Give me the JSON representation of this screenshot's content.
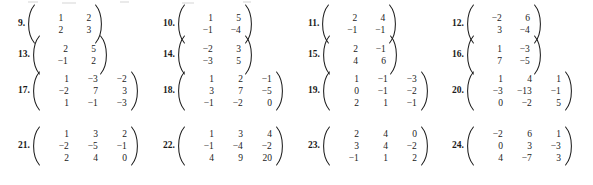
{
  "page": {
    "document_type": "math-textbook-exercise-list",
    "exercises": [
      {
        "number": "9.",
        "rows": [
          [
            "1",
            "2"
          ],
          [
            "2",
            "3"
          ]
        ],
        "size": 2,
        "column": 0,
        "row": 0
      },
      {
        "number": "10.",
        "rows": [
          [
            "1",
            "5"
          ],
          [
            "−1",
            "−4"
          ]
        ],
        "size": 2,
        "column": 1,
        "row": 0
      },
      {
        "number": "11.",
        "rows": [
          [
            "2",
            "4"
          ],
          [
            "−1",
            "−1"
          ]
        ],
        "size": 2,
        "column": 2,
        "row": 0
      },
      {
        "number": "12.",
        "rows": [
          [
            "−2",
            "6"
          ],
          [
            "3",
            "−4"
          ]
        ],
        "size": 2,
        "column": 3,
        "row": 0
      },
      {
        "number": "13.",
        "rows": [
          [
            "2",
            "5"
          ],
          [
            "−1",
            "2"
          ]
        ],
        "size": 2,
        "column": 0,
        "row": 1
      },
      {
        "number": "14.",
        "rows": [
          [
            "−2",
            "3"
          ],
          [
            "−3",
            "5"
          ]
        ],
        "size": 2,
        "column": 1,
        "row": 1
      },
      {
        "number": "15.",
        "rows": [
          [
            "2",
            "−1"
          ],
          [
            "4",
            "6"
          ]
        ],
        "size": 2,
        "column": 2,
        "row": 1
      },
      {
        "number": "16.",
        "rows": [
          [
            "1",
            "−3"
          ],
          [
            "7",
            "−5"
          ]
        ],
        "size": 2,
        "column": 3,
        "row": 1
      },
      {
        "number": "17.",
        "rows": [
          [
            "1",
            "−3",
            "−2"
          ],
          [
            "−2",
            "7",
            "3"
          ],
          [
            "1",
            "−1",
            "−3"
          ]
        ],
        "size": 3,
        "column": 0,
        "row": 2
      },
      {
        "number": "18.",
        "rows": [
          [
            "1",
            "2",
            "−1"
          ],
          [
            "3",
            "7",
            "−5"
          ],
          [
            "−1",
            "−2",
            "0"
          ]
        ],
        "size": 3,
        "column": 1,
        "row": 2
      },
      {
        "number": "19.",
        "rows": [
          [
            "1",
            "−1",
            "−3"
          ],
          [
            "0",
            "−1",
            "−2"
          ],
          [
            "2",
            "1",
            "−1"
          ]
        ],
        "size": 3,
        "column": 2,
        "row": 2
      },
      {
        "number": "20.",
        "rows": [
          [
            "1",
            "4",
            "1"
          ],
          [
            "−3",
            "−13",
            "−1"
          ],
          [
            "0",
            "−2",
            "5"
          ]
        ],
        "size": 3,
        "column": 3,
        "row": 2
      },
      {
        "number": "21.",
        "rows": [
          [
            "1",
            "3",
            "2"
          ],
          [
            "−2",
            "−5",
            "−1"
          ],
          [
            "2",
            "4",
            "0"
          ]
        ],
        "size": 3,
        "column": 0,
        "row": 3
      },
      {
        "number": "22.",
        "rows": [
          [
            "1",
            "3",
            "4"
          ],
          [
            "−1",
            "−4",
            "−2"
          ],
          [
            "4",
            "9",
            "20"
          ]
        ],
        "size": 3,
        "column": 1,
        "row": 3
      },
      {
        "number": "23.",
        "rows": [
          [
            "2",
            "4",
            "0"
          ],
          [
            "3",
            "4",
            "−2"
          ],
          [
            "−1",
            "1",
            "2"
          ]
        ],
        "size": 3,
        "column": 2,
        "row": 3
      },
      {
        "number": "24.",
        "rows": [
          [
            "−2",
            "6",
            "1"
          ],
          [
            "0",
            "3",
            "−3"
          ],
          [
            "4",
            "−7",
            "3"
          ]
        ],
        "size": 3,
        "column": 3,
        "row": 3
      }
    ],
    "layout": {
      "column_x": [
        18,
        163,
        308,
        452
      ],
      "row_y_center": [
        24,
        55,
        91,
        146
      ],
      "row_y_center_3x3": [
        91,
        146
      ]
    },
    "colors": {
      "text": "#1b1b1b",
      "background": "#ffffff"
    }
  }
}
